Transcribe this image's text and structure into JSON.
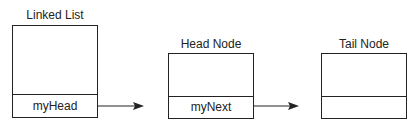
{
  "diagram": {
    "type": "linked-list-structure",
    "nodes": [
      {
        "id": "linked_list",
        "title": "Linked List",
        "field": "myHead"
      },
      {
        "id": "head_node",
        "title": "Head Node",
        "field": "myNext"
      },
      {
        "id": "tail_node",
        "title": "Tail Node",
        "field": ""
      }
    ],
    "edges": [
      {
        "from": "linked_list.myHead",
        "to": "head_node"
      },
      {
        "from": "head_node.myNext",
        "to": "tail_node"
      }
    ],
    "colors": {
      "stroke": "#222222",
      "background": "#ffffff"
    }
  }
}
